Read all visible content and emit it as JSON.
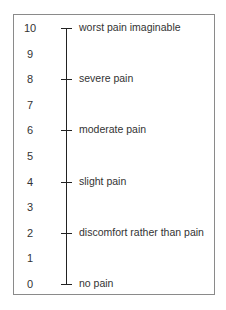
{
  "scale": {
    "title": "",
    "min": 0,
    "max": 10,
    "numbers": [
      "10",
      "9",
      "8",
      "7",
      "6",
      "5",
      "4",
      "3",
      "2",
      "1",
      "0"
    ],
    "anchors": [
      {
        "value": 10,
        "label": "worst pain imaginable"
      },
      {
        "value": 8,
        "label": "severe pain"
      },
      {
        "value": 6,
        "label": "moderate pain"
      },
      {
        "value": 4,
        "label": "slight pain"
      },
      {
        "value": 2,
        "label": "discomfort rather than pain"
      },
      {
        "value": 0,
        "label": "no pain"
      }
    ]
  },
  "colors": {
    "line": "#222222",
    "text": "#333333",
    "border": "#8a8a8a"
  }
}
